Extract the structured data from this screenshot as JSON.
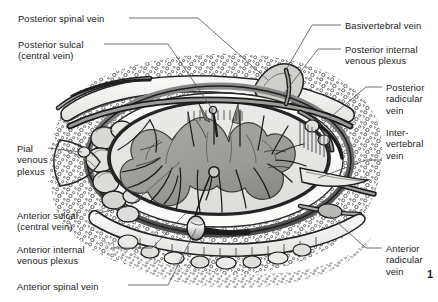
{
  "figure": {
    "background_color": "#ffffff",
    "text_color": "#1b1b1b",
    "leader_line_color": "#55585c",
    "figure_number": "1"
  },
  "labels": {
    "left": [
      {
        "id": "posterior-spinal-vein",
        "lines": [
          "Posterior spinal vein"
        ],
        "x": 18,
        "y": 13,
        "leader": "M 129 18 L 198 18 L 268 80"
      },
      {
        "id": "posterior-sulcal-central-vein",
        "lines": [
          "Posterior sulcal",
          "(central vein)"
        ],
        "x": 18,
        "y": 39,
        "leader": "M 104 44 L 168 44 L 213 110"
      },
      {
        "id": "pial-venous-plexus",
        "lines": [
          "Pial",
          "venous",
          "plexus"
        ],
        "x": 17,
        "y": 143,
        "leader": "M 48 148 L 82 152"
      },
      {
        "id": "anterior-sulcal-central-vein",
        "lines": [
          "Anterior sulcal",
          "(central vein)"
        ],
        "x": 17,
        "y": 210,
        "leader": "M 95 214 L 130 206 L 180 162"
      },
      {
        "id": "anterior-internal-venous-plexus",
        "lines": [
          "Anterior internal",
          "venous plexus"
        ],
        "x": 17,
        "y": 244,
        "leader": "M 111 248 L 152 248 L 186 213"
      },
      {
        "id": "anterior-spinal-vein",
        "lines": [
          "Anterior spinal vein"
        ],
        "x": 17,
        "y": 281,
        "leader": "M 128 285 L 168 285 L 196 229"
      }
    ],
    "right": [
      {
        "id": "basivertebral-vein",
        "lines": [
          "Basivertebral vein"
        ],
        "x": 345,
        "y": 20,
        "leader": "M 341 25 L 312 25 L 286 70"
      },
      {
        "id": "posterior-internal-venous-plexus",
        "lines": [
          "Posterior internal",
          "venous plexus"
        ],
        "x": 345,
        "y": 44,
        "leader": "M 341 49 L 318 49 L 282 96"
      },
      {
        "id": "posterior-radicular-vein",
        "lines": [
          "Posterior",
          "radicular",
          "vein"
        ],
        "x": 386,
        "y": 82,
        "leader": "M 382 87 L 366 87 L 320 126"
      },
      {
        "id": "intervertebral-vein",
        "lines": [
          "Inter-",
          "vertebral",
          "vein"
        ],
        "x": 386,
        "y": 127,
        "leader": "M 382 160 L 366 160 L 318 178"
      },
      {
        "id": "anterior-radicular-vein",
        "lines": [
          "Anterior",
          "radicular",
          "vein"
        ],
        "x": 386,
        "y": 243,
        "leader": "M 382 248 L 366 248 L 330 216"
      }
    ]
  },
  "illustration": {
    "name": "spinal-cord-cross-section",
    "parts": [
      "vertebral body",
      "spinal cord white matter",
      "spinal cord gray matter (butterfly)",
      "dura mater",
      "epidural fat and bone",
      "internal vertebral venous plexus",
      "radicular veins"
    ],
    "colors": {
      "bone_fill": "#f2f1ef",
      "bone_outline": "#2a2a2a",
      "white_matter": "#e2e2e0",
      "gray_matter": "#9b9b99",
      "dura": "#6d6d6b",
      "vein_dark": "#3a3a3a",
      "vein_mid": "#8e8e8c",
      "epidural_fat": "#fbfbfa"
    }
  }
}
